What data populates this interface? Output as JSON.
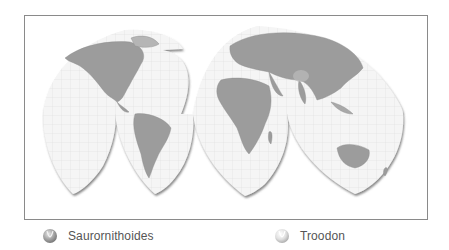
{
  "map": {
    "type": "interrupted world map (homolosine-style lobes)",
    "colors": {
      "frame": "#8a8a8a",
      "ocean": "#f4f4f4",
      "graticule": "#dcdcdc",
      "land": "#9a9a9a",
      "land_dark": "#8a8a8a",
      "lobe_shadow": "#6f6f6f"
    },
    "continents": [
      "North America",
      "South America",
      "Europe",
      "Asia",
      "Africa",
      "Australia"
    ]
  },
  "legend": {
    "items": [
      {
        "label": "Saurornithoides",
        "icon": "dark-sphere-marker",
        "color": "#9a9a9a"
      },
      {
        "label": "Troodon",
        "icon": "light-sphere-marker",
        "color": "#d8d8d8"
      }
    ]
  }
}
